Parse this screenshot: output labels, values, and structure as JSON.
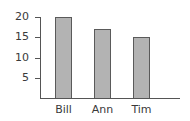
{
  "chart_data": {
    "type": "bar",
    "title": "",
    "xlabel": "",
    "ylabel": "",
    "categories": [
      "Bill",
      "Ann",
      "Tim"
    ],
    "values": [
      20,
      17,
      15
    ],
    "ylim": [
      0,
      20
    ],
    "yticks": [
      5,
      10,
      15,
      20
    ],
    "ytick_labels": [
      "5",
      "10",
      "15",
      "20"
    ],
    "grid": false,
    "legend": null,
    "colors": {
      "bar_fill": "#b3b3b3",
      "bar_edge": "#5a5a5a",
      "axis": "#555555"
    }
  }
}
